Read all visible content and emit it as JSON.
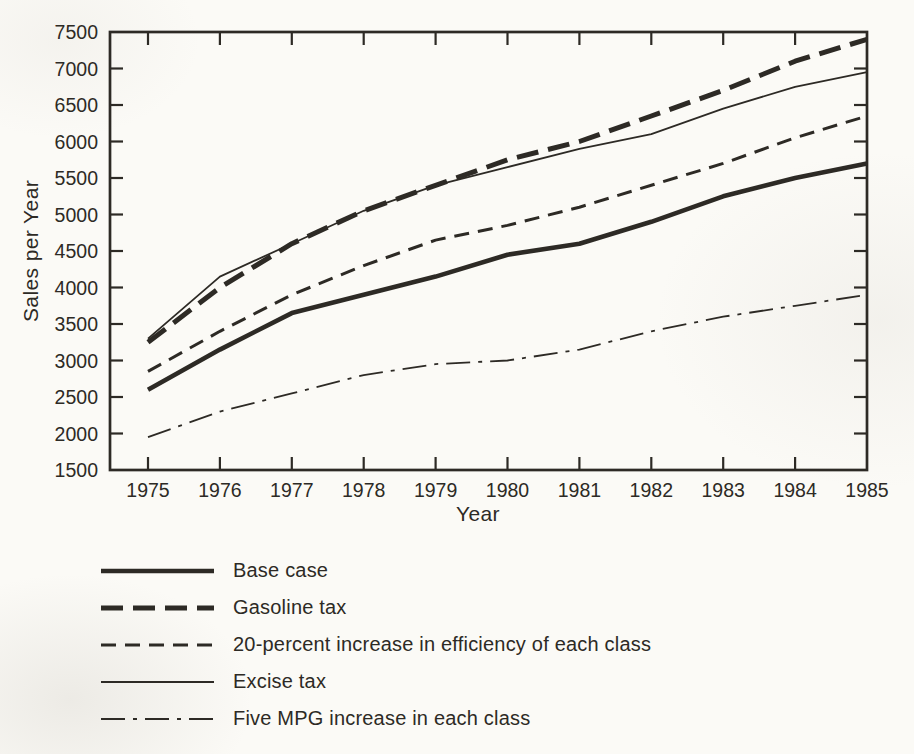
{
  "figure": {
    "background_color": "#fbfaf6",
    "ink_color": "#2d2a25"
  },
  "chart_data": {
    "type": "line",
    "title": "",
    "xlabel": "Year",
    "ylabel": "Sales per Year",
    "x": [
      1975,
      1976,
      1977,
      1978,
      1979,
      1980,
      1981,
      1982,
      1983,
      1984,
      1985
    ],
    "yticks": [
      1500,
      2000,
      2500,
      3000,
      3500,
      4000,
      4500,
      5000,
      5500,
      6000,
      6500,
      7000,
      7500
    ],
    "ylim": [
      1500,
      7500
    ],
    "xlim": [
      1975,
      1985
    ],
    "grid": false,
    "legend_position": "below-left",
    "series": [
      {
        "name": "Base case",
        "line_style": "solid-thick",
        "values": [
          2600,
          3150,
          3650,
          3900,
          4150,
          4450,
          4600,
          4900,
          5250,
          5500,
          5700
        ]
      },
      {
        "name": "Gasoline tax",
        "line_style": "dashed-thick",
        "values": [
          3250,
          4000,
          4600,
          5050,
          5400,
          5750,
          6000,
          6350,
          6700,
          7100,
          7400
        ]
      },
      {
        "name": "20-percent increase in efficiency of each class",
        "line_style": "dashed-medium",
        "values": [
          2850,
          3400,
          3900,
          4300,
          4650,
          4850,
          5100,
          5400,
          5700,
          6050,
          6350
        ]
      },
      {
        "name": "Excise tax",
        "line_style": "solid-thin",
        "values": [
          3300,
          4150,
          4600,
          5050,
          5400,
          5650,
          5900,
          6100,
          6450,
          6750,
          6950
        ]
      },
      {
        "name": "Five MPG increase in each class",
        "line_style": "dashdot-thin",
        "values": [
          1950,
          2300,
          2550,
          2800,
          2950,
          3000,
          3150,
          3400,
          3600,
          3750,
          3900
        ]
      }
    ]
  }
}
